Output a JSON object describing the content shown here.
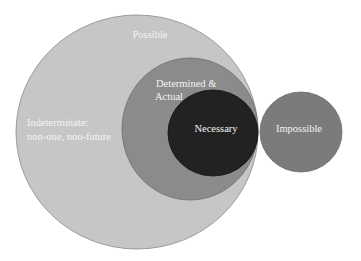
{
  "diagram": {
    "type": "nested-venn",
    "colors": {
      "possible": "#c6c6c6",
      "determined": "#8b8b8b",
      "necessary": "#222222",
      "impossible": "#7b7b7b",
      "outline": "#8e8e8e",
      "text": "#f4f4f4"
    },
    "regions": {
      "possible": {
        "label": "Possible"
      },
      "indeterminate": {
        "line1": "Indeterminate:",
        "line2": "non-one, non-future"
      },
      "determined": {
        "line1": "Determined &",
        "line2": "Actual"
      },
      "necessary": {
        "label": "Necessary"
      },
      "impossible": {
        "label": "Impossible"
      }
    }
  }
}
